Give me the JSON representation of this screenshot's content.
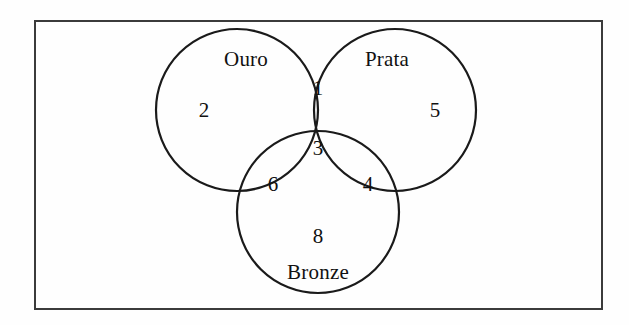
{
  "figure": {
    "type": "venn-diagram-3-set",
    "background_color": "#fefefe",
    "stroke_color": "#1a1a1a",
    "text_color": "#111111",
    "border": {
      "x": 34,
      "y": 20,
      "width": 569,
      "height": 290,
      "stroke_width": 2
    }
  },
  "chart_data": {
    "type": "venn",
    "title": "",
    "sets": [
      {
        "id": "ouro",
        "label": "Ouro",
        "cx": 237,
        "cy": 110,
        "r": 81,
        "only_value": 2
      },
      {
        "id": "prata",
        "label": "Prata",
        "cx": 395,
        "cy": 110,
        "r": 81,
        "only_value": 5
      },
      {
        "id": "bronze",
        "label": "Bronze",
        "cx": 318,
        "cy": 212,
        "r": 81,
        "only_value": 8
      }
    ],
    "regions": [
      {
        "id": "ouro-only",
        "members": [
          "ouro"
        ],
        "value": 2,
        "x": 204,
        "y": 110
      },
      {
        "id": "prata-only",
        "members": [
          "prata"
        ],
        "value": 5,
        "x": 435,
        "y": 110
      },
      {
        "id": "bronze-only",
        "members": [
          "bronze"
        ],
        "value": 8,
        "x": 318,
        "y": 236
      },
      {
        "id": "ouro-prata",
        "members": [
          "ouro",
          "prata"
        ],
        "value": 1,
        "x": 318,
        "y": 88
      },
      {
        "id": "ouro-bronze",
        "members": [
          "ouro",
          "bronze"
        ],
        "value": 6,
        "x": 273,
        "y": 184
      },
      {
        "id": "prata-bronze",
        "members": [
          "prata",
          "bronze"
        ],
        "value": 4,
        "x": 368,
        "y": 184
      },
      {
        "id": "ouro-prata-bronze",
        "members": [
          "ouro",
          "prata",
          "bronze"
        ],
        "value": 3,
        "x": 318,
        "y": 148
      }
    ],
    "set_labels": [
      {
        "id": "label-ouro",
        "text": "Ouro",
        "x": 246,
        "y": 59
      },
      {
        "id": "label-prata",
        "text": "Prata",
        "x": 387,
        "y": 59
      },
      {
        "id": "label-bronze",
        "text": "Bronze",
        "x": 318,
        "y": 272
      }
    ]
  }
}
